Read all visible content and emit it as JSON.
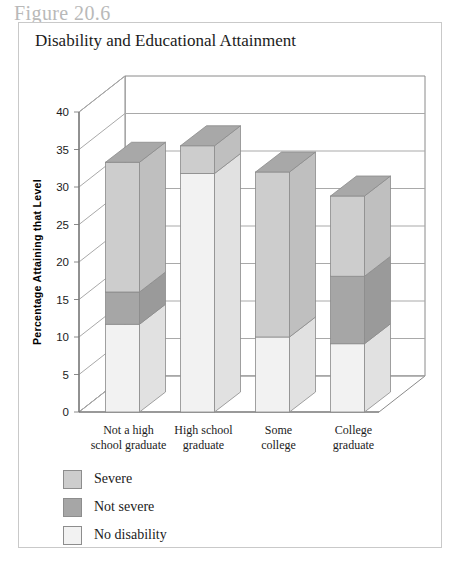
{
  "figure": {
    "number_label": "Figure 20.6",
    "title": "Disability and Educational Attainment"
  },
  "axes": {
    "y_title": "Percentage Attaining that Level",
    "x_title": "Level of Education"
  },
  "legend": {
    "items": [
      {
        "label": "Severe",
        "color": "#cdcdcd"
      },
      {
        "label": "Not severe",
        "color": "#a6a6a6"
      },
      {
        "label": "No disability",
        "color": "#f2f2f2"
      }
    ]
  },
  "chart_data": {
    "type": "bar",
    "stacked": true,
    "orientation": "vertical",
    "three_d": true,
    "title": "Disability and Educational Attainment",
    "xlabel": "Level of Education",
    "ylabel": "Percentage Attaining that Level",
    "ylim": [
      0,
      40
    ],
    "yticks": [
      0,
      5,
      10,
      15,
      20,
      25,
      30,
      35,
      40
    ],
    "ytick_labels": [
      "0",
      "5",
      "10",
      "15",
      "20",
      "25",
      "30",
      "35",
      "40"
    ],
    "grid": true,
    "legend_position": "below-left",
    "categories": [
      "Not a high school graduate",
      "High school graduate",
      "Some college",
      "College graduate"
    ],
    "category_lines": [
      [
        "Not a high",
        "school graduate"
      ],
      [
        "High school",
        "graduate"
      ],
      [
        "Some",
        "college"
      ],
      [
        "College",
        "graduate"
      ]
    ],
    "series": [
      {
        "name": "Severe",
        "color": "#cdcdcd",
        "values": [
          17.3,
          3.7,
          22.0,
          10.7
        ]
      },
      {
        "name": "Not severe",
        "color": "#a6a6a6",
        "values": [
          4.3,
          0.0,
          0.0,
          9.0
        ]
      },
      {
        "name": "No disability",
        "color": "#f2f2f2",
        "values": [
          11.7,
          31.8,
          10.0,
          9.1
        ]
      }
    ],
    "stack_order_bottom_to_top": [
      "No disability",
      "Not severe",
      "Severe"
    ],
    "totals": [
      33.3,
      35.5,
      32.0,
      28.8
    ],
    "segment_boundaries": {
      "Not a high school graduate": {
        "no_disability": [
          0,
          11.7
        ],
        "not_severe": [
          11.7,
          16.0
        ],
        "severe": [
          16.0,
          33.3
        ]
      },
      "High school graduate": {
        "no_disability": [
          0,
          31.8
        ],
        "not_severe": [
          31.8,
          31.8
        ],
        "severe": [
          31.8,
          35.5
        ]
      },
      "Some college": {
        "severe": [
          0,
          22.0
        ],
        "no_disability": [
          22.0,
          32.0
        ]
      },
      "College graduate": {
        "severe": [
          0,
          10.7
        ],
        "not_severe": [
          10.7,
          19.7
        ],
        "no_disability": [
          19.7,
          28.8
        ]
      }
    }
  }
}
